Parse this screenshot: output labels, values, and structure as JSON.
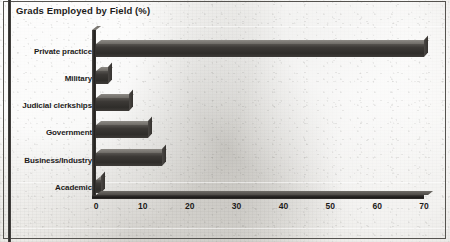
{
  "chart_data": {
    "type": "bar",
    "orientation": "horizontal",
    "title": "Grads Employed by Field (%)",
    "xlabel": "",
    "ylabel": "",
    "xlim": [
      0,
      70
    ],
    "xticks": [
      0,
      10,
      20,
      30,
      40,
      50,
      60,
      70
    ],
    "grid": false,
    "legend": false,
    "categories": [
      "Private practice",
      "Military",
      "Judicial clerkships",
      "Government",
      "Business/Industry",
      "Academic"
    ],
    "values": [
      70,
      2.5,
      7,
      11,
      14,
      1
    ],
    "bars": [
      {
        "label": "Private practice",
        "value": 70
      },
      {
        "label": "Military",
        "value": 2.5
      },
      {
        "label": "Judicial clerkships",
        "value": 7
      },
      {
        "label": "Government",
        "value": 11
      },
      {
        "label": "Business/Industry",
        "value": 14
      },
      {
        "label": "Academic",
        "value": 1
      }
    ],
    "style": {
      "bar_front_color": "#332f2d",
      "bar_top_color": "#7b7873",
      "axis_color": "#1c1a19",
      "text_color": "#1d1b1a",
      "background_color": "#e9e8e4"
    }
  }
}
